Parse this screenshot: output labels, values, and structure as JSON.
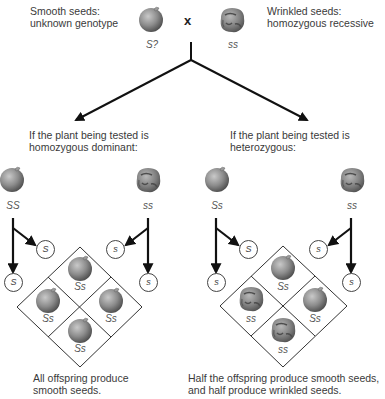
{
  "top": {
    "smooth_label_line1": "Smooth seeds:",
    "smooth_label_line2": "unknown genotype",
    "wrinkled_label_line1": "Wrinkled seeds:",
    "wrinkled_label_line2": "homozygous recessive",
    "cross_symbol": "x",
    "smooth_genotype": "S?",
    "wrinkled_genotype": "ss"
  },
  "left_case": {
    "heading_line1": "If the plant being tested is",
    "heading_line2": "homozygous dominant:",
    "parent1_genotype": "SS",
    "parent2_genotype": "ss",
    "parent1_gametes": [
      "S",
      "S"
    ],
    "parent2_gametes": [
      "s",
      "s"
    ],
    "offspring": [
      {
        "position": "top",
        "genotype": "Ss",
        "phenotype": "smooth"
      },
      {
        "position": "left",
        "genotype": "Ss",
        "phenotype": "smooth"
      },
      {
        "position": "right",
        "genotype": "Ss",
        "phenotype": "smooth"
      },
      {
        "position": "bottom",
        "genotype": "Ss",
        "phenotype": "smooth"
      }
    ],
    "conclusion_line1": "All offspring produce",
    "conclusion_line2": "smooth seeds."
  },
  "right_case": {
    "heading_line1": "If the plant being tested is",
    "heading_line2": "heterozygous:",
    "parent1_genotype": "Ss",
    "parent2_genotype": "ss",
    "parent1_gametes": [
      "S",
      "s"
    ],
    "parent2_gametes": [
      "s",
      "s"
    ],
    "offspring": [
      {
        "position": "top",
        "genotype": "Ss",
        "phenotype": "smooth"
      },
      {
        "position": "left",
        "genotype": "ss",
        "phenotype": "wrinkled"
      },
      {
        "position": "right",
        "genotype": "Ss",
        "phenotype": "smooth"
      },
      {
        "position": "bottom",
        "genotype": "ss",
        "phenotype": "wrinkled"
      }
    ],
    "conclusion_line1": "Half the offspring produce smooth seeds,",
    "conclusion_line2": "and half produce wrinkled seeds."
  },
  "colors": {
    "line": "#111111",
    "pea_smooth": "#8a8a8a",
    "pea_wrinkled": "#7d7d7d"
  },
  "icons": {
    "smooth_seed": "smooth-pea-icon",
    "wrinkled_seed": "wrinkled-pea-icon"
  }
}
